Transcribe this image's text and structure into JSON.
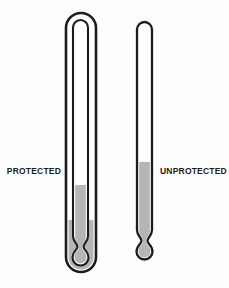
{
  "figure": {
    "labels": {
      "protected": "PROTECTED",
      "unprotected": "UNPROTECTED"
    },
    "colors": {
      "background": "#fdfdfd",
      "outline": "#1c1c1c",
      "glass_fill": "#ffffff",
      "liquid": "#b5b5b5"
    },
    "levels": {
      "protected_column_top_y": 185,
      "protected_case_liquid_top_y": 220,
      "unprotected_column_top_y": 162
    }
  }
}
